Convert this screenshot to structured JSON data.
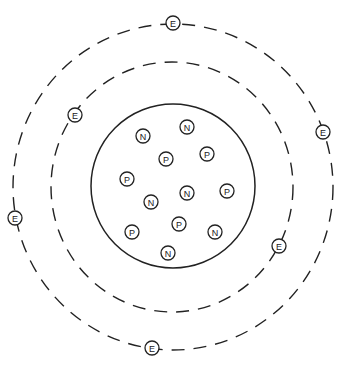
{
  "diagram": {
    "type": "atom-model",
    "nucleus": {
      "cx": 173,
      "cy": 186,
      "r": 82,
      "particles": [
        {
          "label": "N",
          "x": 143,
          "y": 136
        },
        {
          "label": "N",
          "x": 187,
          "y": 127
        },
        {
          "label": "P",
          "x": 166,
          "y": 159
        },
        {
          "label": "P",
          "x": 207,
          "y": 154
        },
        {
          "label": "P",
          "x": 127,
          "y": 179
        },
        {
          "label": "N",
          "x": 187,
          "y": 193
        },
        {
          "label": "P",
          "x": 227,
          "y": 191
        },
        {
          "label": "N",
          "x": 151,
          "y": 202
        },
        {
          "label": "P",
          "x": 179,
          "y": 224
        },
        {
          "label": "P",
          "x": 132,
          "y": 232
        },
        {
          "label": "N",
          "x": 215,
          "y": 232
        },
        {
          "label": "N",
          "x": 168,
          "y": 253
        }
      ]
    },
    "orbits": [
      {
        "name": "inner",
        "cx": 172,
        "cy": 187,
        "rx": 121,
        "ry": 125
      },
      {
        "name": "outer",
        "cx": 173,
        "cy": 187,
        "rx": 160,
        "ry": 163
      }
    ],
    "electrons": [
      {
        "label": "E",
        "x": 173,
        "y": 23
      },
      {
        "label": "E",
        "x": 75,
        "y": 115
      },
      {
        "label": "E",
        "x": 323,
        "y": 132
      },
      {
        "label": "E",
        "x": 15,
        "y": 218
      },
      {
        "label": "E",
        "x": 279,
        "y": 246
      },
      {
        "label": "E",
        "x": 152,
        "y": 348
      }
    ]
  }
}
